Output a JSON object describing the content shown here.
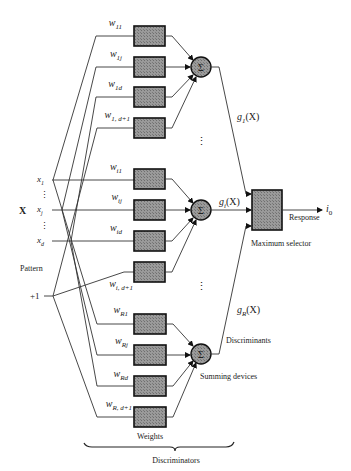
{
  "diagram": {
    "type": "pattern-classifier-block-diagram",
    "input": {
      "vector_label": "X",
      "components": [
        {
          "id": "x1",
          "label": "x",
          "sub": "1"
        },
        {
          "id": "xj",
          "label": "x",
          "sub": "j"
        },
        {
          "id": "xd",
          "label": "x",
          "sub": "d"
        }
      ],
      "bias_label": "+1",
      "caption": "Pattern"
    },
    "discriminators": [
      {
        "id": "group-1",
        "weights": [
          {
            "label": "w",
            "sub": "11"
          },
          {
            "label": "w",
            "sub": "1j"
          },
          {
            "label": "w",
            "sub": "1d"
          },
          {
            "label": "w",
            "sub": "1, d+1"
          }
        ],
        "summer_symbol": "Σ",
        "output_label": "g",
        "output_sub": "1",
        "output_arg": "(X)"
      },
      {
        "id": "group-i",
        "weights": [
          {
            "label": "w",
            "sub": "i1"
          },
          {
            "label": "w",
            "sub": "ij"
          },
          {
            "label": "w",
            "sub": "id"
          },
          {
            "label": "w",
            "sub": "i, d+1"
          }
        ],
        "summer_symbol": "Σ",
        "output_label": "g",
        "output_sub": "i",
        "output_arg": "(X)"
      },
      {
        "id": "group-R",
        "weights": [
          {
            "label": "w",
            "sub": "R1"
          },
          {
            "label": "w",
            "sub": "Rj"
          },
          {
            "label": "w",
            "sub": "Rd"
          },
          {
            "label": "w",
            "sub": "R, d+1"
          }
        ],
        "summer_symbol": "Σ",
        "output_label": "g",
        "output_sub": "R",
        "output_arg": "(X)"
      }
    ],
    "captions": {
      "weights": "Weights",
      "discriminators": "Discriminators",
      "discriminants": "Discriminants",
      "summing_devices": "Summing devices",
      "maximum_selector": "Maximum selector",
      "response": "Response",
      "output": "i",
      "output_sub": "0",
      "ellipsis": "⋮"
    },
    "colors": {
      "line": "#333333",
      "box_fill": "#8a8a8a",
      "box_border": "#111111",
      "background": "#ffffff"
    }
  }
}
